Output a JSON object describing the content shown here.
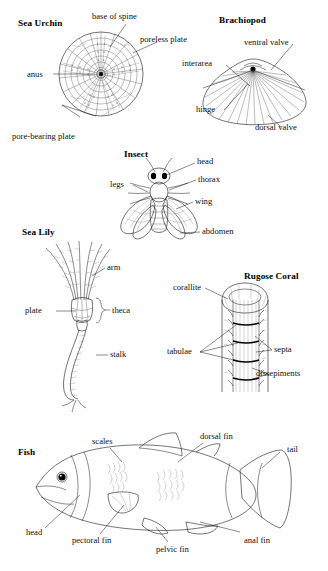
{
  "figure": {
    "background_color": "#fefefe",
    "ink_color": "#1a1a1a",
    "width": 328,
    "height": 571
  },
  "panels": [
    {
      "id": "sea-urchin",
      "heading": "Sea Urchin",
      "labels": [
        "base of spine",
        "poreless plate",
        "anus",
        "pore-bearing plate"
      ]
    },
    {
      "id": "brachiopod",
      "heading": "Brachiopod",
      "labels": [
        "ventral valve",
        "interarea",
        "hinge",
        "dorsal valve"
      ]
    },
    {
      "id": "insect",
      "heading": "Insect",
      "labels": [
        "head",
        "thorax",
        "legs",
        "wing",
        "abdomen"
      ]
    },
    {
      "id": "sea-lily",
      "heading": "Sea Lily",
      "labels": [
        "arm",
        "plate",
        "theca",
        "stalk"
      ]
    },
    {
      "id": "rugose-coral",
      "heading": "Rugose Coral",
      "labels": [
        "corallite",
        "septa",
        "tabulae",
        "dissepiments"
      ]
    },
    {
      "id": "fish",
      "heading": "Fish",
      "labels": [
        "scales",
        "dorsal fin",
        "tail",
        "head",
        "pectoral fin",
        "pelvic fin",
        "anal fin"
      ]
    }
  ],
  "sea_urchin": {
    "heading": "Sea Urchin",
    "base_of_spine": "base of spine",
    "poreless_plate": "poreless plate",
    "anus": "anus",
    "pore_bearing_plate": "pore-bearing plate"
  },
  "brachiopod": {
    "heading": "Brachiopod",
    "ventral_valve": "ventral valve",
    "interarea": "interarea",
    "hinge": "hinge",
    "dorsal_valve": "dorsal valve"
  },
  "insect": {
    "heading": "Insect",
    "head": "head",
    "thorax": "thorax",
    "legs": "legs",
    "wing": "wing",
    "abdomen": "abdomen"
  },
  "sea_lily": {
    "heading": "Sea Lily",
    "arm": "arm",
    "plate": "plate",
    "theca": "theca",
    "stalk": "stalk"
  },
  "rugose_coral": {
    "heading": "Rugose Coral",
    "corallite": "corallite",
    "septa": "septa",
    "tabulae": "tabulae",
    "dissepiments": "dissepiments"
  },
  "fish": {
    "heading": "Fish",
    "scales": "scales",
    "dorsal_fin": "dorsal fin",
    "tail": "tail",
    "head": "head",
    "pectoral_fin": "pectoral fin",
    "pelvic_fin": "pelvic fin",
    "anal_fin": "anal fin"
  }
}
